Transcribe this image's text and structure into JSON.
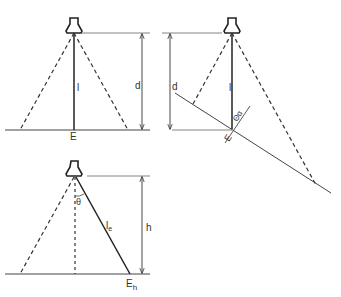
{
  "diagrams": {
    "top_left": {
      "labels": {
        "intensity": "l",
        "distance": "d",
        "illuminance": "E"
      }
    },
    "top_right": {
      "labels": {
        "intensity": "l",
        "distance": "d",
        "illuminance": "E",
        "angle": "Θα"
      }
    },
    "bottom": {
      "labels": {
        "intensity": "l",
        "intensity_sub": "e",
        "height": "h",
        "illuminance": "E",
        "illuminance_sub": "h",
        "angle": "θ"
      }
    }
  },
  "colors": {
    "line": "#333333",
    "background": "#ffffff"
  }
}
